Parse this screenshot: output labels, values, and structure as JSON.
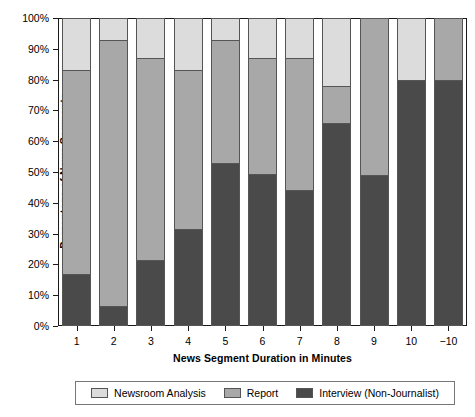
{
  "chart_data": {
    "type": "bar",
    "subtype": "stacked-bar-100-percent",
    "title": "",
    "xlabel": "News Segment Duration in Minutes",
    "ylabel": "Percentage of News Segments",
    "categories": [
      "1",
      "2",
      "3",
      "4",
      "5",
      "6",
      "7",
      "8",
      "9",
      "10",
      "−10"
    ],
    "ylim": [
      0,
      100
    ],
    "ytick_values": [
      0,
      10,
      20,
      30,
      40,
      50,
      60,
      70,
      80,
      90,
      100
    ],
    "ytick_labels": [
      "0%",
      "10%",
      "20%",
      "30%",
      "40%",
      "50%",
      "60%",
      "70%",
      "80%",
      "90%",
      "100%"
    ],
    "grid": false,
    "legend_position": "bottom",
    "stack_order_bottom_to_top": [
      "Interview (Non-Journalist)",
      "Report",
      "Newsroom Analysis"
    ],
    "series": [
      {
        "name": "Interview (Non-Journalist)",
        "color": "#4a4a4a",
        "values": [
          17,
          6.5,
          21.5,
          31.5,
          53,
          49.5,
          44,
          66,
          49,
          80,
          80
        ]
      },
      {
        "name": "Report",
        "color": "#a8a8a8",
        "values": [
          66,
          86.5,
          65.5,
          51.5,
          40,
          37.5,
          43,
          12,
          51,
          0,
          20
        ]
      },
      {
        "name": "Newsroom Analysis",
        "color": "#dcdcdc",
        "values": [
          17,
          7,
          13,
          17,
          7,
          13,
          13,
          22,
          0,
          20,
          0
        ]
      }
    ],
    "cumulative_tops": {
      "Interview (Non-Journalist)": [
        17,
        6.5,
        21.5,
        31.5,
        53,
        49.5,
        44,
        66,
        49,
        80,
        80
      ],
      "Report": [
        83,
        93,
        87,
        83,
        93,
        87,
        87,
        78,
        100,
        80,
        100
      ],
      "Newsroom Analysis": [
        100,
        100,
        100,
        100,
        100,
        100,
        100,
        100,
        100,
        100,
        100
      ]
    }
  },
  "legend": {
    "items": [
      {
        "label": "Newsroom Analysis",
        "color": "#dcdcdc"
      },
      {
        "label": "Report",
        "color": "#a8a8a8"
      },
      {
        "label": "Interview (Non-Journalist)",
        "color": "#4a4a4a"
      }
    ]
  },
  "colors": {
    "newsroom_analysis": "#dcdcdc",
    "report": "#a8a8a8",
    "interview": "#4a4a4a",
    "axis": "#1a1a1a",
    "segment_border": "#555555",
    "background": "#ffffff"
  }
}
